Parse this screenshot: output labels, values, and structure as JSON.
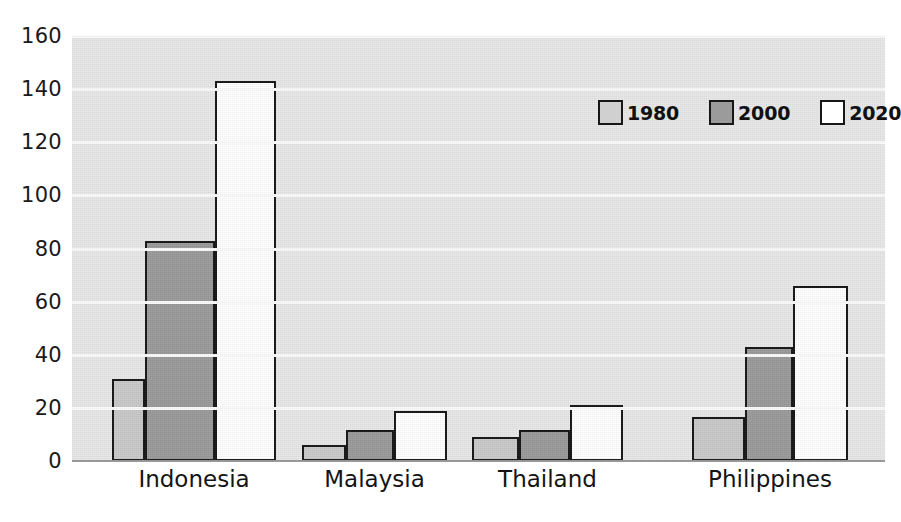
{
  "chart_data": {
    "type": "bar",
    "title": "",
    "subtitle": "",
    "xlabel": "",
    "ylabel": "",
    "categories": [
      "Indonesia",
      "Malaysia",
      "Thailand",
      "Philippines"
    ],
    "series": [
      {
        "name": "1980",
        "color": "#c9c9c9",
        "values": [
          31,
          6,
          9,
          16.5
        ]
      },
      {
        "name": "2000",
        "color": "#9b9b9b",
        "values": [
          83,
          11.5,
          11.5,
          43
        ]
      },
      {
        "name": "2020",
        "color": "#ffffff",
        "values": [
          143,
          19,
          21,
          66
        ]
      }
    ],
    "ylim": [
      0,
      160
    ],
    "yticks": [
      0,
      20,
      40,
      60,
      80,
      100,
      120,
      140,
      160
    ],
    "ytick_labels": [
      "0",
      "20",
      "40",
      "60",
      "80",
      "100",
      "120",
      "140",
      "160"
    ],
    "grid": true,
    "grid_axis": "y",
    "legend_position": "top-right",
    "legend_entries": [
      "1980",
      "2000",
      "2020"
    ],
    "plot_background": "#e8e8e8",
    "gridline_color": "#fbfbfb",
    "bar_outline_color": "#171717"
  }
}
